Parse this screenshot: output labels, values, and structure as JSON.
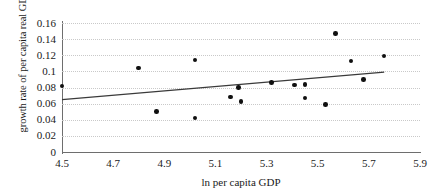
{
  "chart_data": {
    "type": "scatter",
    "title": "",
    "xlabel": "ln per capita GDP",
    "ylabel": "growth rate of per capita real GDP",
    "xlim": [
      4.5,
      5.9
    ],
    "ylim": [
      0,
      0.16
    ],
    "xticks": [
      "4.5",
      "4.7",
      "4.9",
      "5.1",
      "5.3",
      "5.5",
      "5.7",
      "5.9"
    ],
    "xtick_values": [
      4.5,
      4.7,
      4.9,
      5.1,
      5.3,
      5.5,
      5.7,
      5.9
    ],
    "yticks": [
      "0",
      "0.02",
      "0.04",
      "0.06",
      "0.08",
      "0.1",
      "0.12",
      "0.14",
      "0.16"
    ],
    "ytick_values": [
      0,
      0.02,
      0.04,
      0.06,
      0.08,
      0.1,
      0.12,
      0.14,
      0.16
    ],
    "grid": "horizontal-dotted",
    "legend": "none",
    "marker_color": "#101010",
    "trendline_color": "#3a3a3a",
    "gridline_color": "#c9c9c9",
    "axis_color": "#6e6e6e",
    "points": [
      {
        "x": 4.5,
        "y": 0.082
      },
      {
        "x": 4.8,
        "y": 0.104
      },
      {
        "x": 4.87,
        "y": 0.05
      },
      {
        "x": 5.02,
        "y": 0.114
      },
      {
        "x": 5.02,
        "y": 0.042
      },
      {
        "x": 5.16,
        "y": 0.068
      },
      {
        "x": 5.2,
        "y": 0.063
      },
      {
        "x": 5.19,
        "y": 0.08
      },
      {
        "x": 5.32,
        "y": 0.086
      },
      {
        "x": 5.41,
        "y": 0.083
      },
      {
        "x": 5.45,
        "y": 0.084
      },
      {
        "x": 5.45,
        "y": 0.067
      },
      {
        "x": 5.53,
        "y": 0.059
      },
      {
        "x": 5.57,
        "y": 0.147
      },
      {
        "x": 5.63,
        "y": 0.113
      },
      {
        "x": 5.68,
        "y": 0.09
      },
      {
        "x": 5.76,
        "y": 0.119
      }
    ],
    "trendline": {
      "type": "linear-fit",
      "x_start": 4.5,
      "y_start": 0.065,
      "x_end": 5.76,
      "y_end": 0.099
    }
  }
}
